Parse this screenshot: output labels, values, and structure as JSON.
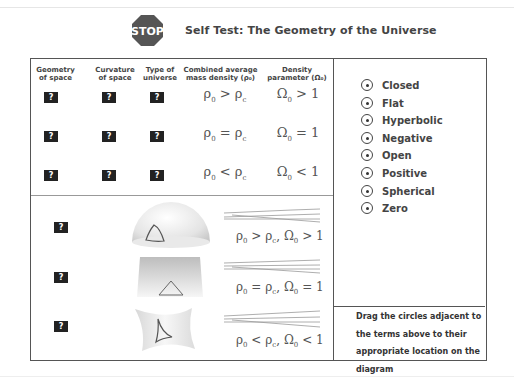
{
  "header": {
    "stop_label": "STOP",
    "title": "Self Test: The Geometry of the Universe"
  },
  "table": {
    "columns": [
      {
        "line1": "Geometry",
        "line2": "of space"
      },
      {
        "line1": "Curvature",
        "line2": "of space"
      },
      {
        "line1": "Type of",
        "line2": "universe"
      },
      {
        "line1": "Combined average",
        "line2": "mass density (ρ₀)"
      },
      {
        "line1": "Density",
        "line2": "parameter  (Ω₀)"
      }
    ],
    "placeholder": "?",
    "rows": [
      {
        "density_lhs": "ρ",
        "density_op": ">",
        "omega_op": ">",
        "omega_val": "1"
      },
      {
        "density_lhs": "ρ",
        "density_op": "=",
        "omega_op": "=",
        "omega_val": "1"
      },
      {
        "density_lhs": "ρ",
        "density_op": "<",
        "omega_op": "<",
        "omega_val": "1"
      }
    ]
  },
  "diagram": {
    "rows": [
      {
        "shape": "sphere",
        "formula": {
          "op1": ">",
          "op2": ">",
          "val": "1"
        }
      },
      {
        "shape": "flat",
        "formula": {
          "op1": "=",
          "op2": "=",
          "val": "1"
        }
      },
      {
        "shape": "saddle",
        "formula": {
          "op1": "<",
          "op2": "<",
          "val": "1"
        }
      }
    ]
  },
  "symbols": {
    "rho": "ρ",
    "omega": "Ω",
    "sub0": "0",
    "subc": "c",
    "comma": ","
  },
  "options": [
    {
      "label": "Closed"
    },
    {
      "label": "Flat"
    },
    {
      "label": "Hyperbolic"
    },
    {
      "label": "Negative"
    },
    {
      "label": "Open"
    },
    {
      "label": "Positive"
    },
    {
      "label": "Spherical"
    },
    {
      "label": "Zero"
    }
  ],
  "instructions": "Drag the circles adjacent to the terms above to their appropriate location on the diagram",
  "colors": {
    "stop_red": "#c0392b",
    "box_dark": "#222222",
    "border": "#555555"
  }
}
